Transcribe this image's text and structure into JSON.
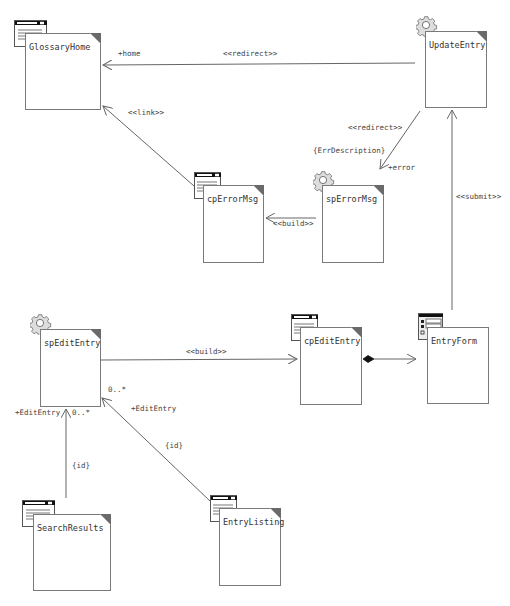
{
  "diagram": {
    "type": "UML web application class diagram",
    "nodes": [
      {
        "id": "glossary_home",
        "name": "GlossaryHome",
        "stereotype_icon": "client-page-icon",
        "x": 25,
        "y": 33,
        "w": 76,
        "h": 77
      },
      {
        "id": "update_entry",
        "name": "UpdateEntry",
        "stereotype_icon": "server-page-gear-icon",
        "x": 425,
        "y": 31,
        "w": 62,
        "h": 77
      },
      {
        "id": "cp_error_msg",
        "name": "cpErrorMsg",
        "stereotype_icon": "client-page-icon",
        "x": 203,
        "y": 185,
        "w": 61,
        "h": 78
      },
      {
        "id": "sp_error_msg",
        "name": "spErrorMsg",
        "stereotype_icon": "server-page-gear-icon",
        "x": 322,
        "y": 185,
        "w": 62,
        "h": 78
      },
      {
        "id": "sp_edit_entry",
        "name": "spEditEntry",
        "stereotype_icon": "server-page-gear-icon",
        "x": 40,
        "y": 329,
        "w": 61,
        "h": 78
      },
      {
        "id": "cp_edit_entry",
        "name": "cpEditEntry",
        "stereotype_icon": "client-page-icon",
        "x": 300,
        "y": 327,
        "w": 62,
        "h": 78
      },
      {
        "id": "entry_form",
        "name": "EntryForm",
        "stereotype_icon": "form-icon",
        "x": 427,
        "y": 327,
        "w": 62,
        "h": 77
      },
      {
        "id": "search_results",
        "name": "SearchResults",
        "stereotype_icon": "client-page-icon",
        "x": 33,
        "y": 514,
        "w": 78,
        "h": 77
      },
      {
        "id": "entry_listing",
        "name": "EntryListing",
        "stereotype_icon": "client-page-icon",
        "x": 219,
        "y": 508,
        "w": 62,
        "h": 78
      }
    ],
    "edges": [
      {
        "id": "update_to_glossary",
        "from": "UpdateEntry",
        "to": "GlossaryHome",
        "stereotype": "<<redirect>>",
        "role": "+home"
      },
      {
        "id": "cperror_to_glossary",
        "from": "cpErrorMsg",
        "to": "GlossaryHome",
        "stereotype": "<<link>>"
      },
      {
        "id": "update_to_sperror",
        "from": "UpdateEntry",
        "to": "spErrorMsg",
        "stereotype": "<<redirect>>",
        "constraint": "{ErrDescription}",
        "role": "+error"
      },
      {
        "id": "sperror_to_cperror",
        "from": "spErrorMsg",
        "to": "cpErrorMsg",
        "stereotype": "<<build>>"
      },
      {
        "id": "form_to_update",
        "from": "EntryForm",
        "to": "UpdateEntry",
        "stereotype": "<<submit>>"
      },
      {
        "id": "spedit_to_cpedit",
        "from": "spEditEntry",
        "to": "cpEditEntry",
        "stereotype": "<<build>>"
      },
      {
        "id": "cpedit_to_form",
        "from": "cpEditEntry",
        "to": "EntryForm",
        "kind": "composition"
      },
      {
        "id": "search_to_spedit",
        "from": "SearchResults",
        "to": "spEditEntry",
        "constraint": "{id}",
        "role": "+EditEntry",
        "multiplicity": "0..*"
      },
      {
        "id": "listing_to_spedit",
        "from": "EntryListing",
        "to": "spEditEntry",
        "constraint": "{id}",
        "role": "+EditEntry",
        "multiplicity": "0..*"
      }
    ]
  },
  "labels": {
    "home_role": "+home",
    "redirect_top": "<<redirect>>",
    "link": "<<link>>",
    "redirect_error": "<<redirect>>",
    "err_description": "{ErrDescription}",
    "error_role": "+error",
    "build_error": "<<build>>",
    "submit": "<<submit>>",
    "build_edit": "<<build>>",
    "mult_listing": "0..*",
    "role_listing": "+EditEntry",
    "id_listing": "{id}",
    "role_search": "+EditEntry",
    "mult_search": "0..*",
    "id_search": "{id}"
  },
  "colors": {
    "line": "#666666",
    "box_border": "#7a7a7a",
    "fold": "#6a6a6a",
    "text": "#333333"
  }
}
